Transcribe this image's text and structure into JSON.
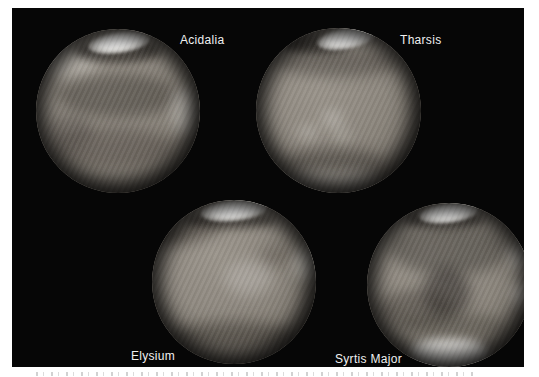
{
  "figure": {
    "background_color": "#ffffff",
    "panel_color": "#060606"
  },
  "globes": [
    {
      "id": "acidalia",
      "label": "Acidalia"
    },
    {
      "id": "tharsis",
      "label": "Tharsis"
    },
    {
      "id": "elysium",
      "label": "Elysium"
    },
    {
      "id": "syrtis",
      "label": "Syrtis Major"
    }
  ],
  "colors": {
    "label_text": "#f0f0f0",
    "mars_surface_base": "#8b857c",
    "mars_dark_markings": "#544e48",
    "polar_cap": "#f8f8f6",
    "panel_black": "#060606"
  }
}
